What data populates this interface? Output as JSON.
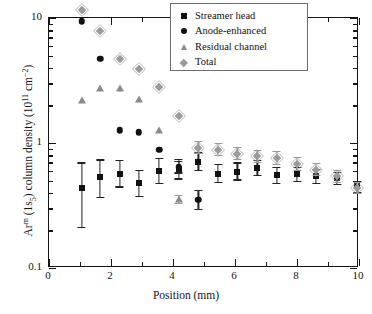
{
  "chart_data": {
    "type": "scatter",
    "title": "",
    "xlabel": "Position (mm)",
    "ylabel": "Arᵐ (1s₅) column density (10¹¹ cm⁻²)",
    "ylabel_parts": {
      "pre": "Ar",
      "sup1": "m",
      "mid": " (1s",
      "sub1": "5",
      "mid2": ") column density (10",
      "sup2": "11",
      "post": " cm",
      "sup3": "−2",
      "tail": ")"
    },
    "xscale": "linear",
    "yscale": "log",
    "xlim": [
      0,
      10
    ],
    "ylim": [
      0.1,
      10
    ],
    "grid": false,
    "legend_position": "upper right",
    "x_ticks": [
      0,
      2,
      4,
      6,
      8,
      10
    ],
    "x_ticklabels": [
      "0",
      "2",
      "4",
      "6",
      "8",
      "10"
    ],
    "x_minor_ticks": [
      1,
      3,
      5,
      7,
      9
    ],
    "y_ticks": [
      0.1,
      1,
      10
    ],
    "y_ticklabels": [
      "0.1",
      "1",
      "10"
    ],
    "series": [
      {
        "name": "Streamer head",
        "marker": "square",
        "color": "#111111",
        "x": [
          1.05,
          1.65,
          2.28,
          2.9,
          3.55,
          4.18,
          4.82,
          5.45,
          6.08,
          6.72,
          7.35,
          8.0,
          8.62,
          9.3,
          9.95
        ],
        "y": [
          0.44,
          0.53,
          0.57,
          0.48,
          0.6,
          0.62,
          0.71,
          0.57,
          0.59,
          0.63,
          0.55,
          0.56,
          0.54,
          0.52,
          0.45
        ],
        "yerr_low": [
          0.23,
          0.17,
          0.13,
          0.11,
          0.13,
          0.11,
          0.11,
          0.09,
          0.09,
          0.09,
          0.08,
          0.07,
          0.07,
          0.06,
          0.05
        ],
        "yerr_high": [
          0.26,
          0.21,
          0.16,
          0.13,
          0.16,
          0.13,
          0.13,
          0.11,
          0.11,
          0.1,
          0.09,
          0.08,
          0.08,
          0.07,
          0.05
        ]
      },
      {
        "name": "Anode-enhanced",
        "marker": "circle",
        "color": "#111111",
        "x": [
          1.05,
          1.65,
          2.28,
          2.9,
          3.55,
          4.18,
          4.82
        ],
        "y": [
          9.4,
          4.7,
          1.27,
          1.22,
          0.88,
          0.64,
          0.35
        ],
        "yerr_low": [
          0,
          0,
          0,
          0,
          0,
          0.07,
          0.06
        ],
        "yerr_high": [
          0,
          0,
          0,
          0,
          0,
          0.08,
          0.07
        ]
      },
      {
        "name": "Residual channel",
        "marker": "triangle",
        "color": "#8a8a8a",
        "x": [
          1.05,
          1.65,
          2.28,
          2.9,
          3.55,
          4.18
        ],
        "y": [
          2.2,
          2.75,
          2.75,
          2.25,
          1.28,
          0.355
        ],
        "yerr_low": [
          0,
          0,
          0,
          0,
          0,
          0.03
        ],
        "yerr_high": [
          0,
          0,
          0,
          0,
          0,
          0.03
        ]
      },
      {
        "name": "Total",
        "marker": "diamond",
        "color": "#9a9a9a",
        "x": [
          1.05,
          1.65,
          2.28,
          2.9,
          3.55,
          4.18,
          4.82,
          5.45,
          6.08,
          6.72,
          7.35,
          8.0,
          8.62,
          9.3,
          9.95
        ],
        "y": [
          11.5,
          7.8,
          4.7,
          3.9,
          2.8,
          1.63,
          0.92,
          0.88,
          0.82,
          0.78,
          0.76,
          0.68,
          0.61,
          0.54,
          0.44
        ],
        "yerr_low": [
          0,
          0,
          0,
          0,
          0,
          0,
          0.1,
          0.1,
          0.09,
          0.09,
          0.09,
          0.08,
          0.07,
          0.06,
          0.05
        ],
        "yerr_high": [
          0,
          0,
          0,
          0,
          0,
          0,
          0.12,
          0.12,
          0.11,
          0.1,
          0.1,
          0.09,
          0.08,
          0.07,
          0.05
        ]
      }
    ]
  },
  "legend": {
    "items": [
      {
        "label": "Streamer head",
        "marker": "square"
      },
      {
        "label": "Anode-enhanced",
        "marker": "circle"
      },
      {
        "label": "Residual channel",
        "marker": "triangle"
      },
      {
        "label": "Total",
        "marker": "diamond"
      }
    ]
  }
}
